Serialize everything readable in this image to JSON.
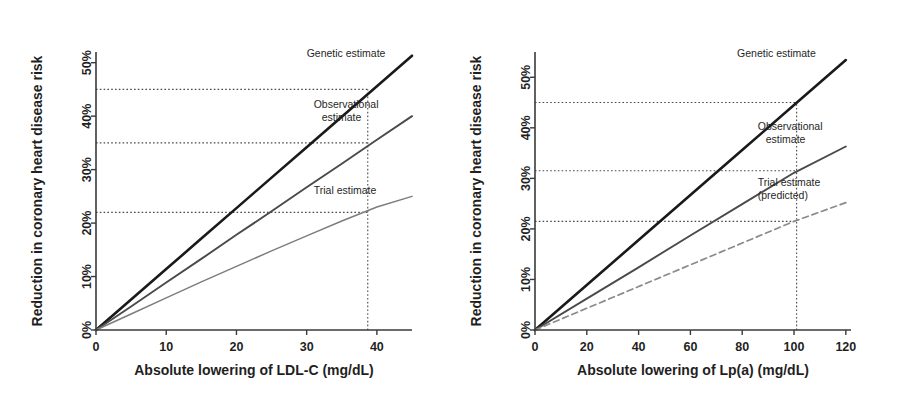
{
  "figure": {
    "background": "#ffffff"
  },
  "colors": {
    "genetic": "#1a1a1a",
    "observational": "#4a4a4a",
    "trial": "#7d7d7d",
    "trial_predicted": "#8a8a8a",
    "axis": "#3a3a3a",
    "reference": "#4a4a4a"
  },
  "chart_data": [
    {
      "type": "line",
      "panel": "left",
      "title": "",
      "xlabel": "Absolute lowering of LDL-C (mg/dL)",
      "ylabel": "Reduction in coronary heart disease risk",
      "xlim": [
        0,
        45
      ],
      "ylim": [
        0,
        52
      ],
      "xticks": [
        0,
        10,
        20,
        30,
        40
      ],
      "xticklabels": [
        "0",
        "10",
        "20",
        "30",
        "40"
      ],
      "yticks": [
        0,
        10,
        20,
        30,
        40,
        50
      ],
      "yticklabels": [
        "0%",
        "10%",
        "20%",
        "30%",
        "40%",
        "50%"
      ],
      "grid": false,
      "legend": "none",
      "annotations": [
        {
          "label": "Genetic estimate",
          "x": 30.0,
          "y": 51.0
        },
        {
          "label": "Observational estimate",
          "x": 31.0,
          "y": 41.5
        },
        {
          "label": "Trial estimate",
          "x": 31.0,
          "y": 25.5
        }
      ],
      "series": [
        {
          "name": "Genetic estimate",
          "style": "solid",
          "color": "#1a1a1a",
          "x": [
            0,
            5,
            10,
            15,
            20,
            25,
            30,
            35,
            40,
            45
          ],
          "values": [
            0,
            5.7,
            11.4,
            17.1,
            22.8,
            28.5,
            34.2,
            39.9,
            45.6,
            51.3
          ]
        },
        {
          "name": "Observational estimate",
          "style": "solid",
          "color": "#4a4a4a",
          "x": [
            0,
            5,
            10,
            15,
            20,
            25,
            30,
            35,
            40,
            45
          ],
          "values": [
            0,
            4.4,
            8.9,
            13.3,
            17.8,
            22.2,
            26.7,
            31.1,
            35.6,
            40.0
          ]
        },
        {
          "name": "Trial estimate",
          "style": "solid",
          "color": "#7d7d7d",
          "x": [
            0,
            5,
            10,
            15,
            20,
            25,
            30,
            35,
            40,
            45
          ],
          "values": [
            0,
            3.0,
            6.0,
            9.0,
            11.9,
            14.8,
            17.6,
            20.4,
            23.0,
            25.0
          ]
        }
      ],
      "reference_lines": [
        {
          "orientation": "horizontal",
          "value": 45.0,
          "label": "45%",
          "from_x": 0,
          "to_x": 38.7
        },
        {
          "orientation": "horizontal",
          "value": 35.0,
          "label": "35%",
          "from_x": 0,
          "to_x": 38.7
        },
        {
          "orientation": "horizontal",
          "value": 22.0,
          "label": "22%",
          "from_x": 0,
          "to_x": 38.7
        },
        {
          "orientation": "vertical",
          "value": 38.7,
          "label": "38.7",
          "from_y": 0,
          "to_y": 45.0
        }
      ]
    },
    {
      "type": "line",
      "panel": "right",
      "title": "",
      "xlabel": "Absolute lowering of Lp(a) (mg/dL)",
      "ylabel": "Reduction in coronary heart disease risk",
      "xlim": [
        0,
        122
      ],
      "ylim": [
        0,
        55
      ],
      "xticks": [
        0,
        20,
        40,
        60,
        80,
        100,
        120
      ],
      "xticklabels": [
        "0",
        "20",
        "40",
        "60",
        "80",
        "100",
        "120"
      ],
      "yticks": [
        0,
        10,
        20,
        30,
        40,
        50
      ],
      "yticklabels": [
        "0%",
        "10%",
        "20%",
        "30%",
        "40%",
        "50%"
      ],
      "grid": false,
      "legend": "none",
      "annotations": [
        {
          "label": "Genetic estimate",
          "x": 78.0,
          "y": 54.0
        },
        {
          "label": "Observational estimate",
          "x": 86.0,
          "y": 39.5
        },
        {
          "label": "Trial estimate (predicted)",
          "x": 86.0,
          "y": 28.5
        }
      ],
      "series": [
        {
          "name": "Genetic estimate",
          "style": "solid",
          "color": "#1a1a1a",
          "x": [
            0,
            20,
            40,
            60,
            80,
            100,
            120
          ],
          "values": [
            0,
            8.9,
            17.8,
            26.7,
            35.6,
            44.5,
            53.4
          ]
        },
        {
          "name": "Observational estimate",
          "style": "solid",
          "color": "#4a4a4a",
          "x": [
            0,
            20,
            40,
            60,
            80,
            100,
            120
          ],
          "values": [
            0,
            6.2,
            12.4,
            18.7,
            24.9,
            31.1,
            36.3
          ]
        },
        {
          "name": "Trial estimate (predicted)",
          "style": "dashed",
          "color": "#8a8a8a",
          "x": [
            0,
            20,
            40,
            60,
            80,
            100,
            120
          ],
          "values": [
            0,
            4.3,
            8.6,
            12.9,
            17.2,
            21.5,
            25.2
          ]
        }
      ],
      "reference_lines": [
        {
          "orientation": "horizontal",
          "value": 45.0,
          "label": "45%",
          "from_x": 0,
          "to_x": 101.0
        },
        {
          "orientation": "horizontal",
          "value": 31.5,
          "label": "31.5%",
          "from_x": 0,
          "to_x": 101.0
        },
        {
          "orientation": "horizontal",
          "value": 21.5,
          "label": "21.5%",
          "from_x": 0,
          "to_x": 101.0
        },
        {
          "orientation": "vertical",
          "value": 101.0,
          "label": "101",
          "from_y": 0,
          "to_y": 45.0
        }
      ]
    }
  ]
}
